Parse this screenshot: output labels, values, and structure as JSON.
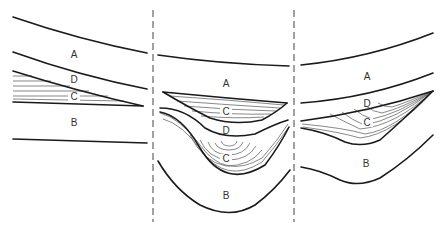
{
  "diagram": {
    "type": "geological cross-section",
    "panels": [
      {
        "id": "left",
        "labels": {
          "a": "A",
          "d": "D",
          "c": "C",
          "b": "B"
        }
      },
      {
        "id": "middle",
        "labels": {
          "a": "A",
          "c_upper": "C",
          "d": "D",
          "c_lower": "C",
          "b": "B"
        }
      },
      {
        "id": "right",
        "labels": {
          "a": "A",
          "d": "D",
          "c": "C",
          "b": "B"
        }
      }
    ],
    "colors": {
      "boundary": "#1a1a1a",
      "lamination": "#555555",
      "divider": "#555555",
      "label": "#333333",
      "background": "#ffffff"
    }
  }
}
